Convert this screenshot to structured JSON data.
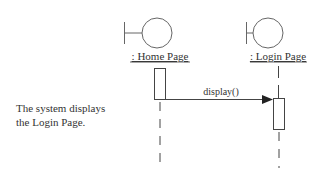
{
  "diagram": {
    "type": "sequence-diagram",
    "note_lines": [
      "The system displays",
      "the Login Page."
    ],
    "lifelines": [
      {
        "id": "home",
        "label": ": Home Page",
        "kind": "boundary"
      },
      {
        "id": "login",
        "label": ": Login Page",
        "kind": "boundary"
      }
    ],
    "messages": [
      {
        "from": "home",
        "to": "login",
        "label": "display()",
        "arrow": "synchronous"
      }
    ],
    "colors": {
      "stroke": "#555555",
      "text": "#333333",
      "background": "#ffffff"
    }
  }
}
